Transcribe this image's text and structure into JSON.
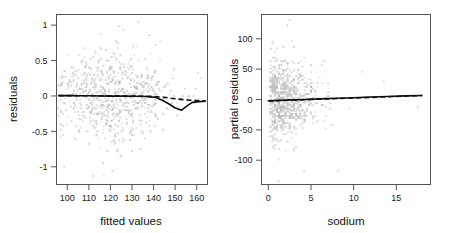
{
  "figure": {
    "background": "#ffffff",
    "point_color": "#b9b9b9",
    "line_color": "#111111",
    "axis_color": "#555555"
  },
  "chart_data": [
    {
      "type": "scatter",
      "panel": "left",
      "title": "",
      "xlabel": "fitted values",
      "ylabel": "residuals",
      "xlim": [
        95,
        165
      ],
      "ylim": [
        -1.25,
        1.15
      ],
      "xticks": [
        100,
        110,
        120,
        130,
        140,
        150,
        160
      ],
      "yticks": [
        1,
        0.5,
        0,
        -0.5,
        -1
      ],
      "xticklabels": [
        "100",
        "110",
        "120",
        "130",
        "140",
        "150",
        "160"
      ],
      "yticklabels": [
        "1",
        "0.5",
        "0",
        "-0.5",
        "-1"
      ],
      "grid": false,
      "legend": "none",
      "series": [
        {
          "name": "loess smooth",
          "style": "solid",
          "x": [
            96,
            101,
            106,
            111,
            116,
            121,
            126,
            131,
            136,
            141,
            144,
            147,
            150,
            153,
            156,
            158,
            161,
            164
          ],
          "y": [
            0.005,
            0.004,
            0.003,
            0.002,
            0.0,
            -0.002,
            -0.003,
            -0.004,
            -0.007,
            -0.02,
            -0.06,
            -0.11,
            -0.17,
            -0.2,
            -0.13,
            -0.09,
            -0.08,
            -0.075
          ]
        },
        {
          "name": "reference line",
          "style": "dashed",
          "x": [
            96,
            110,
            125,
            138,
            145,
            150,
            155,
            160,
            164
          ],
          "y": [
            0.005,
            0.003,
            0.0,
            -0.004,
            -0.02,
            -0.04,
            -0.055,
            -0.065,
            -0.07
          ]
        }
      ],
      "points": {
        "x_center": 120,
        "x_spread": 14,
        "y_center": 0,
        "y_spread": 0.3,
        "n": 780,
        "note": "dense discretized cloud of light gray residual points, widest near x=118-130, with sparse outliers near y=-1.1"
      }
    },
    {
      "type": "scatter",
      "panel": "right",
      "title": "",
      "xlabel": "sodium",
      "ylabel": "partial residuals",
      "xlim": [
        -0.8,
        19
      ],
      "ylim": [
        -140,
        140
      ],
      "xticks": [
        0,
        5,
        10,
        15
      ],
      "yticks": [
        100,
        50,
        0,
        -50,
        -100
      ],
      "xticklabels": [
        "0",
        "5",
        "10",
        "15"
      ],
      "yticklabels": [
        "100",
        "50",
        "0",
        "-50",
        "-100"
      ],
      "grid": false,
      "legend": "none",
      "series": [
        {
          "name": "loess smooth",
          "style": "solid",
          "x": [
            0,
            2,
            4,
            6,
            8,
            10,
            12,
            14,
            16,
            18
          ],
          "y": [
            -2,
            -1,
            0,
            1,
            2,
            3,
            4,
            5,
            6,
            6.5
          ]
        },
        {
          "name": "reference line",
          "style": "dashed",
          "x": [
            0,
            3,
            6,
            9,
            12,
            15,
            18
          ],
          "y": [
            -2.5,
            -1,
            0.5,
            2,
            3.5,
            5,
            6.5
          ]
        }
      ],
      "points": {
        "x_center": 3.2,
        "x_spread": 2.6,
        "y_center": 0,
        "y_spread": 28,
        "n": 780,
        "note": "dense light gray cloud concentrated at low sodium values, thinning toward the right; outliers near y=130 and y=-130"
      }
    }
  ]
}
